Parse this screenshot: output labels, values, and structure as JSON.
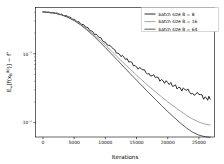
{
  "chart_data": {
    "type": "line",
    "title": "",
    "xlabel": "Iterations",
    "ylabel": "E_ω[f(x_B^{(k)})] − f*",
    "xlim": [
      -1200,
      27500
    ],
    "ylim": [
      0.0062,
      0.47
    ],
    "yscale": "log",
    "xscale": "linear",
    "grid": false,
    "legend_position": "upper right",
    "xticks": [
      0,
      5000,
      10000,
      15000,
      20000,
      25000
    ],
    "xticklabels": [
      "0",
      "5000",
      "10000",
      "15000",
      "20000",
      "25000"
    ],
    "yticks": [
      0.1,
      0.01
    ],
    "yticklabels": [
      "10⁻¹",
      "10⁻²"
    ],
    "x": [
      0,
      1000,
      2000,
      3000,
      4000,
      5000,
      6000,
      7000,
      8000,
      9000,
      10000,
      11000,
      12000,
      13000,
      14000,
      15000,
      16000,
      17000,
      18000,
      19000,
      20000,
      21000,
      22000,
      23000,
      24000,
      25000,
      26000,
      26800
    ],
    "series": [
      {
        "name": "batch size B = 8",
        "color": "#2b2b2b",
        "linewidth": 1.0,
        "values": [
          0.405,
          0.4,
          0.39,
          0.372,
          0.347,
          0.315,
          0.279,
          0.242,
          0.206,
          0.174,
          0.146,
          0.122,
          0.103,
          0.0875,
          0.0752,
          0.0652,
          0.0575,
          0.0512,
          0.046,
          0.0415,
          0.0376,
          0.0344,
          0.0316,
          0.0292,
          0.0271,
          0.0252,
          0.0234,
          0.0222
        ]
      },
      {
        "name": "batch size B = 16",
        "color": "#9a9a9a",
        "linewidth": 0.9,
        "values": [
          0.405,
          0.399,
          0.388,
          0.369,
          0.342,
          0.309,
          0.271,
          0.232,
          0.195,
          0.162,
          0.133,
          0.109,
          0.0888,
          0.0725,
          0.0594,
          0.0489,
          0.0405,
          0.0337,
          0.0282,
          0.0238,
          0.0201,
          0.0172,
          0.0148,
          0.0128,
          0.0113,
          0.0102,
          0.00955,
          0.00925
        ]
      },
      {
        "name": "batch size B = 64",
        "color": "#4a4a4a",
        "linewidth": 0.9,
        "values": [
          0.405,
          0.398,
          0.386,
          0.366,
          0.338,
          0.303,
          0.264,
          0.224,
          0.186,
          0.152,
          0.123,
          0.0992,
          0.0797,
          0.064,
          0.0514,
          0.0414,
          0.0334,
          0.027,
          0.0219,
          0.0178,
          0.0145,
          0.012,
          0.00995,
          0.0084,
          0.00728,
          0.0066,
          0.00625,
          0.00615
        ]
      }
    ],
    "noise": {
      "batch size B = 8": [
        0,
        0.002,
        -0.003,
        0.004,
        -0.002,
        0.003,
        -0.004,
        0.002,
        0.005,
        -0.003,
        0.004,
        0.006,
        -0.004,
        0.005,
        0.007,
        -0.005,
        0.006,
        0.004,
        -0.006,
        0.007,
        0.005,
        -0.004,
        0.006,
        0.005,
        -0.005,
        0.006,
        0.004,
        -0.003
      ]
    }
  }
}
